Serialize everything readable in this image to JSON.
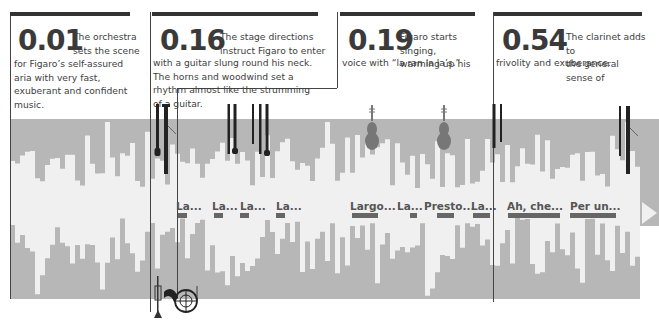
{
  "captions": [
    {
      "time": "0.01",
      "text_top": "The orchestra\nsets the scene",
      "text_body": "for Figaro’s self-assured aria with very fast, exuberant and confident music."
    },
    {
      "time": "0.16",
      "text_top": "The stage directions\ninstruct Figaro to enter",
      "text_body": "with a guitar slung round his neck. The horns and woodwind set a rhythm almost like the strumming of a guitar."
    },
    {
      "time": "0.19",
      "text_top": "Figaro starts singing,\nwarming up his",
      "text_body": "voice with “la ran la la’s.”"
    },
    {
      "time": "0.54",
      "text_top": "The clarinet adds to\nthe general sense of",
      "text_body": "frivolity and exuberance."
    }
  ],
  "lyrics": [
    "La...",
    "La...",
    "La...",
    "La...",
    "Largo...",
    "La...",
    "Presto...",
    "La...",
    "Ah, che...",
    "Per un..."
  ],
  "instruments": [
    "oboe",
    "clarinet",
    "oboe",
    "oboe",
    "flute",
    "oboe",
    "oboe",
    "violin",
    "violin",
    "oboe",
    "oboe",
    "oboe",
    "clarinet",
    "trumpet",
    "french-horn"
  ],
  "colors": {
    "band": "#b7b7b7",
    "wave": "#f0f0f0",
    "ink": "#333333",
    "lyric_bar": "#666666"
  }
}
